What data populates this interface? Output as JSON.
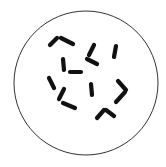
{
  "figure": {
    "background_color": "#ffffff",
    "field": {
      "shape": "circle",
      "cx": 86,
      "cy": 83,
      "r": 72,
      "stroke_color": "#333333",
      "stroke_width": 1
    },
    "chromosome_color": "#111111",
    "chromosome_width": 4.2,
    "chromosomes": [
      {
        "id": "c1a",
        "x1": 50,
        "y1": 45,
        "x2": 57,
        "y2": 38
      },
      {
        "id": "c1b",
        "x1": 61,
        "y1": 38,
        "x2": 73,
        "y2": 44
      },
      {
        "id": "c2a",
        "x1": 94,
        "y1": 45,
        "x2": 89,
        "y2": 55
      },
      {
        "id": "c2b",
        "x1": 87,
        "y1": 59,
        "x2": 97,
        "y2": 64
      },
      {
        "id": "c3",
        "x1": 116,
        "y1": 46,
        "x2": 114,
        "y2": 57
      },
      {
        "id": "c4a",
        "x1": 63,
        "y1": 59,
        "x2": 64,
        "y2": 70
      },
      {
        "id": "c4b",
        "x1": 70,
        "y1": 72,
        "x2": 81,
        "y2": 72
      },
      {
        "id": "c5",
        "x1": 49,
        "y1": 78,
        "x2": 54,
        "y2": 88
      },
      {
        "id": "c6a",
        "x1": 64,
        "y1": 89,
        "x2": 59,
        "y2": 99
      },
      {
        "id": "c6b",
        "x1": 63,
        "y1": 103,
        "x2": 75,
        "y2": 108
      },
      {
        "id": "c7",
        "x1": 91,
        "y1": 84,
        "x2": 92,
        "y2": 95
      },
      {
        "id": "c8a",
        "x1": 118,
        "y1": 81,
        "x2": 126,
        "y2": 90
      },
      {
        "id": "c8b",
        "x1": 125,
        "y1": 92,
        "x2": 116,
        "y2": 102
      },
      {
        "id": "c9a",
        "x1": 97,
        "y1": 118,
        "x2": 104,
        "y2": 110
      },
      {
        "id": "c9b",
        "x1": 106,
        "y1": 110,
        "x2": 114,
        "y2": 116
      }
    ]
  }
}
